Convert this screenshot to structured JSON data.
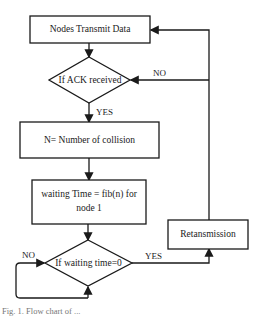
{
  "diagram": {
    "type": "flowchart",
    "nodes": {
      "transmit": {
        "shape": "process",
        "label": "Nodes Transmit Data"
      },
      "ack_check": {
        "shape": "decision",
        "label": "If ACK received"
      },
      "collision_count": {
        "shape": "process",
        "label": "N= Number of collision"
      },
      "waiting_time": {
        "shape": "process",
        "label_line1": "waiting Time = fib(n) for",
        "label_line2": "node 1"
      },
      "wait_check": {
        "shape": "decision",
        "label": "If waiting time=0"
      },
      "retransmission": {
        "shape": "process",
        "label": "Retansmission"
      }
    },
    "edges": {
      "ack_no": {
        "from": "ack_check",
        "to": "transmit",
        "label": "NO"
      },
      "ack_yes": {
        "from": "ack_check",
        "to": "collision_count",
        "label": "YES"
      },
      "wait_no": {
        "from": "wait_check",
        "to": "wait_check",
        "label": "NO"
      },
      "wait_yes": {
        "from": "wait_check",
        "to": "retransmission",
        "label": "YES"
      }
    },
    "caption": "Fig. 1.  Flow chart of ..."
  }
}
